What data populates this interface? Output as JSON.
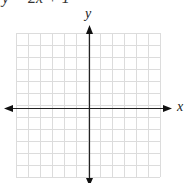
{
  "header": {
    "cutoff_equation": "y = 2x + 1"
  },
  "graph": {
    "x_label": "x",
    "y_label": "y",
    "grid": {
      "left": 16,
      "top": 33,
      "cell": 12,
      "cols": 12,
      "rows": 12,
      "color": "#dcdcdc"
    },
    "axes": {
      "origin_x": 89,
      "origin_y": 108,
      "color": "#222222"
    }
  }
}
